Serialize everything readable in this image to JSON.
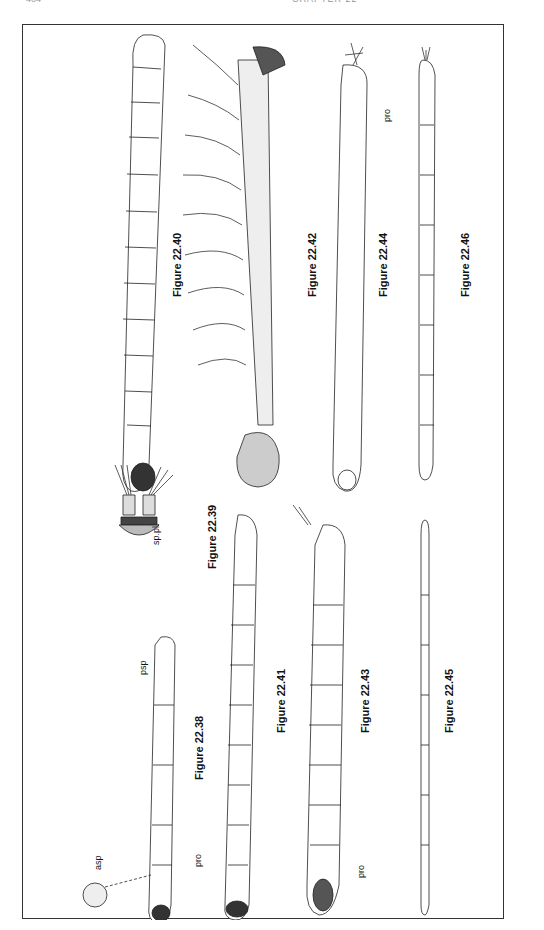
{
  "page": {
    "header_left": "404",
    "header_center": "CHAPTER 22"
  },
  "plate": {
    "orientation": "rotated-90",
    "figures": [
      {
        "id": "22.38",
        "label": "Figure 22.38",
        "annotations": [
          "asp",
          "pro",
          "psp"
        ]
      },
      {
        "id": "22.39",
        "label": "Figure 22.39",
        "annotations": [
          "sp.pl."
        ]
      },
      {
        "id": "22.40",
        "label": "Figure 22.40",
        "annotations": []
      },
      {
        "id": "22.41",
        "label": "Figure 22.41",
        "annotations": []
      },
      {
        "id": "22.42",
        "label": "Figure 22.42",
        "annotations": []
      },
      {
        "id": "22.43",
        "label": "Figure 22.43",
        "annotations": [
          "pro"
        ]
      },
      {
        "id": "22.44",
        "label": "Figure 22.44",
        "annotations": [
          "pro"
        ]
      },
      {
        "id": "22.45",
        "label": "Figure 22.45",
        "annotations": []
      },
      {
        "id": "22.46",
        "label": "Figure 22.46",
        "annotations": []
      }
    ]
  },
  "colors": {
    "ink": "#111111",
    "frame": "#333333",
    "paper": "#ffffff"
  }
}
